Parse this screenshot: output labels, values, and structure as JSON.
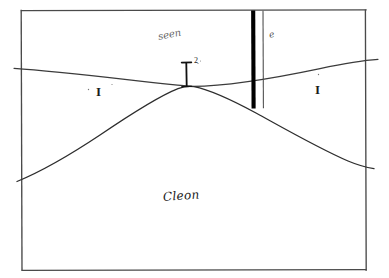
{
  "figure": {
    "kind": "hand-drawn geological cross-section sketch",
    "background_color": "#ffffff",
    "ink_color": "#1c1c1c",
    "frame": {
      "name": "rectangular pencil border",
      "left": 21,
      "top": 10,
      "right": 366,
      "bottom": 270,
      "stroke_color": "#4a4a4a"
    },
    "labels": {
      "unit_left": "I",
      "unit_center": "I",
      "unit_center_superscript": "2",
      "unit_right": "I",
      "annotation_upper": "seen",
      "annotation_borehole": "e",
      "annotation_bottom": "Cleon"
    },
    "features": [
      {
        "name": "unconformity-surface",
        "description": "gently sloping near-horizontal line crossing the full width",
        "left_y": 68,
        "right_y": 60,
        "color": "#3b3b3b"
      },
      {
        "name": "anticline-fold-axis",
        "description": "broad arched curve peaking at the centre of the section",
        "apex_x": 190,
        "apex_y": 86,
        "left_edge_y": 178,
        "right_edge_y": 165,
        "color": "#2d2d2d"
      },
      {
        "name": "borehole-well-trace",
        "description": "heavy vertical bar from the top frame down past the fold limb",
        "x": 253,
        "top_y": 11,
        "bottom_y": 108,
        "color": "#000000"
      },
      {
        "name": "borehole-casing-line",
        "description": "thin vertical line immediately right of the heavy borehole bar",
        "x": 263,
        "top_y": 11,
        "bottom_y": 108,
        "color": "#4a4a4a"
      },
      {
        "name": "fold-crest-marker",
        "description": "short vertical tick with serif cap above the fold apex",
        "x": 186,
        "top_y": 62,
        "bottom_y": 86,
        "color": "#111111"
      }
    ]
  }
}
